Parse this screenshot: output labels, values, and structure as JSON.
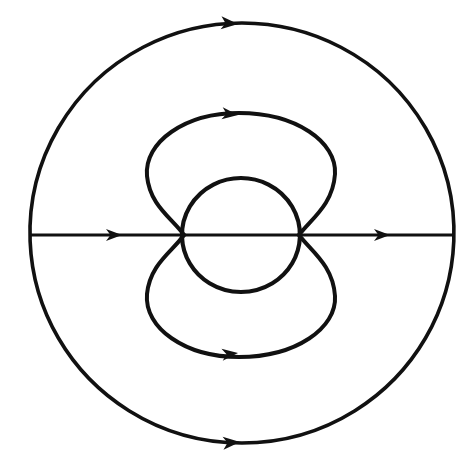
{
  "figure": {
    "background_color": "#ffffff",
    "stroke_color": "#111111",
    "width": 472,
    "height": 462
  },
  "geometry": {
    "center": {
      "x": 242,
      "y": 234
    },
    "axis": {
      "y": 235,
      "x_start": 30,
      "x_end": 455,
      "stroke_width": 3.2
    },
    "outer_circle": {
      "cx": 242,
      "cy": 233,
      "rx": 212,
      "ry": 210,
      "stroke_width": 3.6
    },
    "inner_circle": {
      "cx": 241,
      "cy": 235,
      "rx": 59,
      "ry": 57,
      "stroke_width": 4.2
    },
    "upper_lobe": {
      "left_x": 146,
      "right_x": 337,
      "top_y": 113,
      "attach_left_x": 184,
      "attach_right_x": 299,
      "attach_y": 235,
      "stroke_width": 4.0
    },
    "lower_lobe": {
      "left_x": 146,
      "right_x": 337,
      "bottom_y": 357,
      "attach_left_x": 184,
      "attach_right_x": 299,
      "attach_y": 235,
      "stroke_width": 4.0
    }
  },
  "arrows": [
    {
      "name": "outer-top-arrow",
      "x": 238,
      "y": 24,
      "direction": "left",
      "angle_deg": 184,
      "size": 15
    },
    {
      "name": "outer-bottom-arrow",
      "x": 240,
      "y": 442,
      "direction": "left",
      "angle_deg": 176,
      "size": 15
    },
    {
      "name": "upper-lobe-arrow",
      "x": 238,
      "y": 115,
      "direction": "left",
      "angle_deg": 186,
      "size": 14
    },
    {
      "name": "lower-lobe-arrow",
      "x": 238,
      "y": 353,
      "direction": "left",
      "angle_deg": 174,
      "size": 14
    },
    {
      "name": "axis-left-arrow",
      "x": 122,
      "y": 235,
      "direction": "right",
      "angle_deg": 0,
      "size": 14
    },
    {
      "name": "axis-right-arrow",
      "x": 390,
      "y": 235,
      "direction": "right",
      "angle_deg": 0,
      "size": 14
    }
  ],
  "paths": {
    "outer_circle_d": "M 242 23 A 212 210 0 1 1 241.9 23 Z",
    "axis_d": "M 30 235 L 455 235",
    "inner_circle_d": "M 241 178 A 59 57 0 1 1 240.9 178 Z",
    "upper_lobe_d": "M 184 235 C 172 218 150 206 147 176 C 144 142 185 113 239 113 C 296 113 337 142 335 174 C 333 205 311 219 299 235",
    "lower_lobe_d": "M 184 235 C 172 252 150 264 147 294 C 144 328 185 357 239 357 C 296 357 337 328 335 296 C 333 265 311 251 299 235"
  }
}
